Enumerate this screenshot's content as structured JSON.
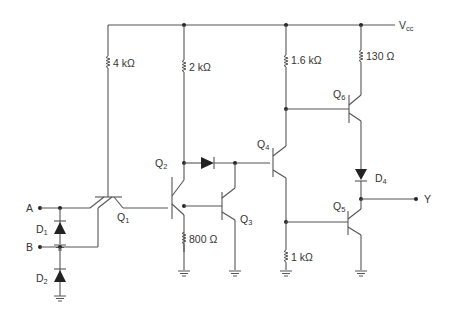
{
  "supply": {
    "name": "V",
    "sub": "cc"
  },
  "inputs": {
    "a": "A",
    "b": "B"
  },
  "output": "Y",
  "resistors": {
    "r1": "4 kΩ",
    "r2": "2 kΩ",
    "r3": "1.6 kΩ",
    "r4": "130 Ω",
    "r5": "800 Ω",
    "r6": "1 kΩ"
  },
  "transistors": [
    {
      "name": "Q",
      "sub": "1"
    },
    {
      "name": "Q",
      "sub": "2"
    },
    {
      "name": "Q",
      "sub": "3"
    },
    {
      "name": "Q",
      "sub": "4"
    },
    {
      "name": "Q",
      "sub": "5"
    },
    {
      "name": "Q",
      "sub": "6"
    }
  ],
  "diodes": [
    {
      "name": "D",
      "sub": "1"
    },
    {
      "name": "D",
      "sub": "2"
    },
    {
      "name": "D",
      "sub": "4"
    }
  ]
}
